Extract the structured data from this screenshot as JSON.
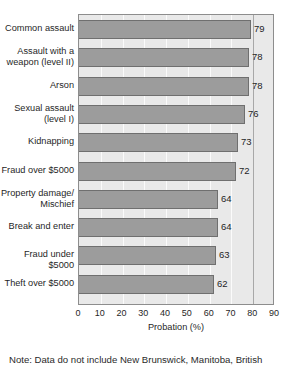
{
  "chart_data": {
    "type": "bar",
    "orientation": "horizontal",
    "title": "",
    "xlabel": "Probation (%)",
    "ylabel": "",
    "xlim": [
      0,
      90
    ],
    "xticks": [
      0,
      10,
      20,
      30,
      40,
      50,
      60,
      70,
      80,
      90
    ],
    "xtick_labels": [
      "0",
      "10",
      "20",
      "30",
      "40",
      "50",
      "60",
      "70",
      "80",
      "90"
    ],
    "grid": true,
    "legend": null,
    "categories": [
      "Common assault",
      "Assault with a\nweapon (level II)",
      "Arson",
      "Sexual assault\n(level I)",
      "Kidnapping",
      "Fraud over $5000",
      "Property damage/\nMischief",
      "Break and enter",
      "Fraud under $5000",
      "Theft over $5000"
    ],
    "values": [
      79,
      78,
      78,
      76,
      73,
      72,
      64,
      64,
      63,
      62
    ],
    "value_labels": [
      "79",
      "78",
      "78",
      "76",
      "73",
      "72",
      "64",
      "64",
      "63",
      "62"
    ],
    "colors": {
      "bar_fill": "#9c9c9c",
      "bar_edge": "#6f6f6f",
      "plot_background": "#e9e9e9",
      "gridline": "#fbfbfb",
      "gridline_major": "#a8a8a8",
      "axis": "#8d8d8d",
      "text": "#1f1f1f"
    }
  },
  "footer": {
    "note": "Note: Data do not include New Brunswick, Manitoba, British"
  }
}
